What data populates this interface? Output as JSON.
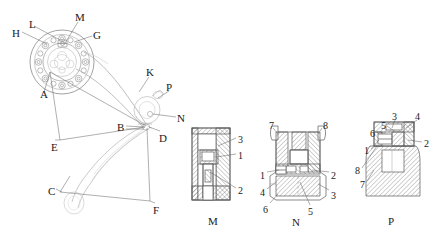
{
  "figure": {
    "background": "#ffffff",
    "line_color": "#555555",
    "thin_line_color": "#999999",
    "text_color": "#1a1a1a",
    "hatch_color": "#666666"
  },
  "main_assembly": {
    "name": "main-assembly-view",
    "callouts": [
      {
        "id": "H",
        "label": "H",
        "x": 12,
        "y": 28,
        "lead_to_x": 48,
        "lead_to_y": 45
      },
      {
        "id": "L",
        "label": "L",
        "x": 29,
        "y": 19,
        "lead_to_x": 62,
        "lead_to_y": 39
      },
      {
        "id": "M",
        "label": "M",
        "x": 75,
        "y": 12,
        "lead_to_x": 66,
        "lead_to_y": 43
      },
      {
        "id": "G",
        "label": "G",
        "x": 93,
        "y": 30,
        "lead_to_x": 72,
        "lead_to_y": 41
      },
      {
        "id": "K",
        "label": "K",
        "x": 146,
        "y": 67,
        "lead_to_x": 137,
        "lead_to_y": 93
      },
      {
        "id": "P",
        "label": "P",
        "x": 166,
        "y": 82,
        "lead_to_x": 155,
        "lead_to_y": 100
      },
      {
        "id": "N",
        "label": "N",
        "x": 177,
        "y": 113,
        "lead_to_x": 151,
        "lead_to_y": 114
      },
      {
        "id": "A",
        "label": "A",
        "x": 40,
        "y": 89,
        "lead_to_x": 50,
        "lead_to_y": 70
      },
      {
        "id": "B",
        "label": "B",
        "x": 117,
        "y": 122,
        "lead_to_x": 145,
        "lead_to_y": 127
      },
      {
        "id": "D",
        "label": "D",
        "x": 159,
        "y": 133,
        "lead_to_x": 147,
        "lead_to_y": 127
      },
      {
        "id": "E",
        "label": "E",
        "x": 51,
        "y": 142,
        "lead_to_x": 60,
        "lead_to_y": 140
      },
      {
        "id": "C",
        "label": "C",
        "x": 48,
        "y": 186,
        "lead_to_x": 60,
        "lead_to_y": 192
      },
      {
        "id": "F",
        "label": "F",
        "x": 153,
        "y": 205,
        "lead_to_x": 150,
        "lead_to_y": 200
      }
    ]
  },
  "detail_views": [
    {
      "id": "M",
      "name": "detail-view-m",
      "caption": "M",
      "caption_x": 208,
      "caption_y": 216,
      "numbers": [
        {
          "value": "3",
          "x": 238,
          "y": 135
        },
        {
          "value": "1",
          "x": 238,
          "y": 151
        },
        {
          "value": "2",
          "x": 238,
          "y": 186
        }
      ]
    },
    {
      "id": "N",
      "name": "detail-view-n",
      "caption": "N",
      "caption_x": 292,
      "caption_y": 217,
      "numbers": [
        {
          "value": "7",
          "x": 269,
          "y": 121
        },
        {
          "value": "8",
          "x": 323,
          "y": 121
        },
        {
          "value": "1",
          "x": 260,
          "y": 171
        },
        {
          "value": "2",
          "x": 331,
          "y": 171
        },
        {
          "value": "4",
          "x": 260,
          "y": 188
        },
        {
          "value": "3",
          "x": 331,
          "y": 191
        },
        {
          "value": "6",
          "x": 263,
          "y": 205
        },
        {
          "value": "5",
          "x": 308,
          "y": 207
        }
      ]
    },
    {
      "id": "P",
      "name": "detail-view-p",
      "caption": "P",
      "caption_x": 388,
      "caption_y": 216,
      "numbers": [
        {
          "value": "3",
          "x": 392,
          "y": 112
        },
        {
          "value": "4",
          "x": 415,
          "y": 112
        },
        {
          "value": "5",
          "x": 381,
          "y": 121
        },
        {
          "value": "6",
          "x": 370,
          "y": 129
        },
        {
          "value": "2",
          "x": 424,
          "y": 139
        },
        {
          "value": "1",
          "x": 364,
          "y": 146
        },
        {
          "value": "8",
          "x": 355,
          "y": 166
        },
        {
          "value": "7",
          "x": 360,
          "y": 180
        }
      ]
    }
  ]
}
